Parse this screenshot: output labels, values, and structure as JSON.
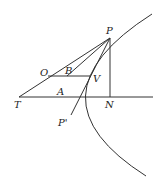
{
  "diagram": {
    "labels": {
      "P": "P",
      "O": "O",
      "B": "B",
      "V": "V",
      "T": "T",
      "A": "A",
      "N": "N",
      "P_prime": "P'"
    },
    "colors": {
      "line": "#333333",
      "text": "#222222",
      "background": "#ffffff"
    }
  }
}
